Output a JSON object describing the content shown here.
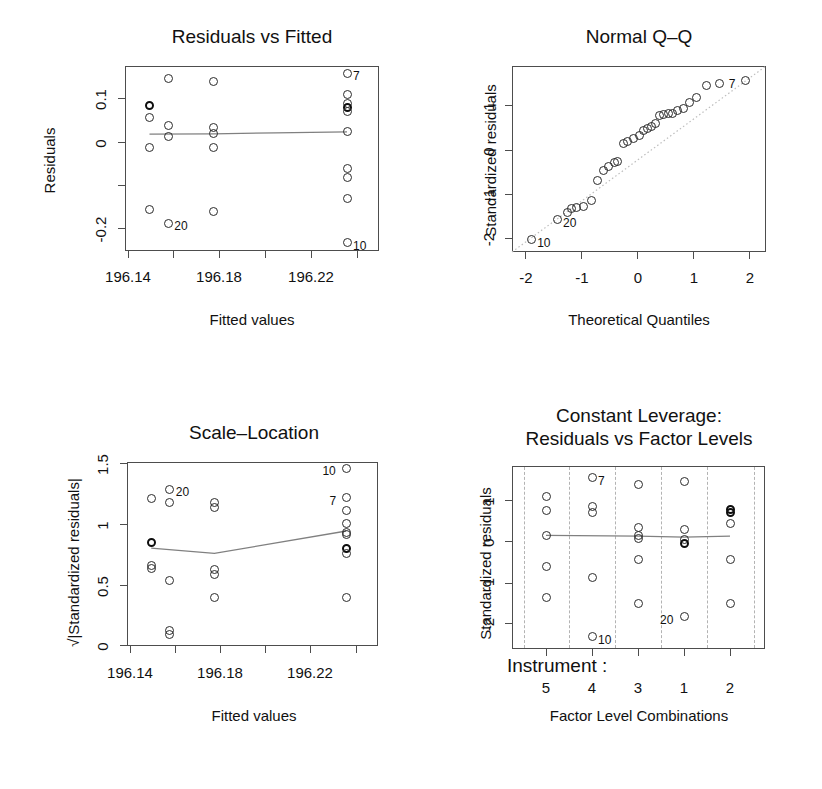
{
  "figure": {
    "kind": "R regression diagnostic plots (2x2)",
    "background": "#ffffff",
    "point_color": "#2b2b2b",
    "line_color": "#808080",
    "grid_color": "#b3b3b3"
  },
  "chart_data": [
    {
      "type": "scatter",
      "panel": "top-left",
      "title": "Residuals vs Fitted",
      "xlabel": "Fitted values",
      "ylabel": "Residuals",
      "xlim": [
        196.12,
        196.255
      ],
      "ylim": [
        -0.24,
        0.145
      ],
      "xticks": [
        196.14,
        196.18,
        196.22
      ],
      "xticks_all": [
        196.14,
        196.16,
        196.18,
        196.2,
        196.22,
        196.24
      ],
      "yticks": [
        0.1,
        0.0,
        -0.2
      ],
      "yticks_all": [
        0.1,
        0.0,
        -0.1,
        -0.2
      ],
      "grid": false,
      "legend": "none",
      "points": [
        {
          "x": 196.133,
          "y": 0.063,
          "bold": true
        },
        {
          "x": 196.133,
          "y": 0.037
        },
        {
          "x": 196.133,
          "y": -0.025
        },
        {
          "x": 196.133,
          "y": -0.153
        },
        {
          "x": 196.143,
          "y": 0.118
        },
        {
          "x": 196.143,
          "y": 0.022
        },
        {
          "x": 196.143,
          "y": -0.002
        },
        {
          "x": 196.143,
          "y": -0.182,
          "label": "20"
        },
        {
          "x": 196.167,
          "y": 0.113
        },
        {
          "x": 196.167,
          "y": 0.018
        },
        {
          "x": 196.167,
          "y": 0.004
        },
        {
          "x": 196.167,
          "y": -0.024
        },
        {
          "x": 196.167,
          "y": -0.157
        },
        {
          "x": 196.238,
          "y": 0.13,
          "label": "7"
        },
        {
          "x": 196.238,
          "y": 0.085
        },
        {
          "x": 196.238,
          "y": 0.067
        },
        {
          "x": 196.238,
          "y": 0.058,
          "bold": true
        },
        {
          "x": 196.238,
          "y": 0.05
        },
        {
          "x": 196.238,
          "y": 0.008
        },
        {
          "x": 196.238,
          "y": -0.068
        },
        {
          "x": 196.238,
          "y": -0.086
        },
        {
          "x": 196.238,
          "y": -0.13
        },
        {
          "x": 196.238,
          "y": -0.223,
          "label": "10"
        }
      ],
      "smoother": [
        {
          "x": 196.133,
          "y": 0.003
        },
        {
          "x": 196.167,
          "y": 0.004
        },
        {
          "x": 196.2,
          "y": 0.006
        },
        {
          "x": 196.238,
          "y": 0.008
        }
      ]
    },
    {
      "type": "scatter",
      "panel": "top-right",
      "title": "Normal Q–Q",
      "xlabel": "Theoretical Quantiles",
      "ylabel": "Standardized residuals",
      "xlim": [
        -2.45,
        2.45
      ],
      "ylim": [
        -2.45,
        1.75
      ],
      "xticks": [
        -2,
        -1,
        0,
        1,
        2
      ],
      "yticks": [
        1,
        0,
        -1,
        -2
      ],
      "grid": false,
      "legend": "none",
      "reference_line": {
        "from": [
          -2.45,
          -2.45
        ],
        "to": [
          2.45,
          1.75
        ],
        "style": "dotted"
      },
      "points": [
        {
          "x": -2.08,
          "y": -2.17,
          "label": "10",
          "label_side": "right"
        },
        {
          "x": -1.58,
          "y": -1.72,
          "label": "20",
          "label_side": "right"
        },
        {
          "x": -1.38,
          "y": -1.55
        },
        {
          "x": -1.3,
          "y": -1.47
        },
        {
          "x": -1.2,
          "y": -1.44
        },
        {
          "x": -1.08,
          "y": -1.42
        },
        {
          "x": -0.92,
          "y": -1.28
        },
        {
          "x": -0.8,
          "y": -0.83
        },
        {
          "x": -0.68,
          "y": -0.62
        },
        {
          "x": -0.58,
          "y": -0.52
        },
        {
          "x": -0.48,
          "y": -0.42
        },
        {
          "x": -0.42,
          "y": -0.4
        },
        {
          "x": -0.3,
          "y": 0.0
        },
        {
          "x": -0.22,
          "y": 0.04
        },
        {
          "x": -0.1,
          "y": 0.12
        },
        {
          "x": 0.0,
          "y": 0.18
        },
        {
          "x": 0.08,
          "y": 0.3
        },
        {
          "x": 0.16,
          "y": 0.34
        },
        {
          "x": 0.24,
          "y": 0.38
        },
        {
          "x": 0.32,
          "y": 0.46
        },
        {
          "x": 0.4,
          "y": 0.64
        },
        {
          "x": 0.48,
          "y": 0.66
        },
        {
          "x": 0.56,
          "y": 0.68
        },
        {
          "x": 0.64,
          "y": 0.68
        },
        {
          "x": 0.74,
          "y": 0.74
        },
        {
          "x": 0.86,
          "y": 0.8
        },
        {
          "x": 0.98,
          "y": 0.92
        },
        {
          "x": 1.1,
          "y": 1.04
        },
        {
          "x": 1.3,
          "y": 1.3
        },
        {
          "x": 1.56,
          "y": 1.36
        },
        {
          "x": 2.06,
          "y": 1.42,
          "label": "7",
          "label_side": "left"
        }
      ]
    },
    {
      "type": "scatter",
      "panel": "bottom-left",
      "title": "Scale–Location",
      "xlabel": "Fitted values",
      "ylabel": "√|Standardized residuals|",
      "xlim": [
        196.12,
        196.255
      ],
      "ylim": [
        -0.03,
        1.53
      ],
      "xticks": [
        196.14,
        196.18,
        196.22
      ],
      "xticks_all": [
        196.14,
        196.16,
        196.18,
        196.2,
        196.22,
        196.24
      ],
      "yticks": [
        1.5,
        1.0,
        0.5,
        0.0
      ],
      "grid": false,
      "legend": "none",
      "points": [
        {
          "x": 196.133,
          "y": 1.22
        },
        {
          "x": 196.133,
          "y": 0.845,
          "bold": true
        },
        {
          "x": 196.133,
          "y": 0.655
        },
        {
          "x": 196.133,
          "y": 0.625
        },
        {
          "x": 196.143,
          "y": 1.3,
          "label": "20",
          "label_side": "right"
        },
        {
          "x": 196.143,
          "y": 1.19
        },
        {
          "x": 196.143,
          "y": 0.525
        },
        {
          "x": 196.143,
          "y": 0.105
        },
        {
          "x": 196.143,
          "y": 0.065
        },
        {
          "x": 196.167,
          "y": 1.185
        },
        {
          "x": 196.167,
          "y": 1.145
        },
        {
          "x": 196.167,
          "y": 0.615
        },
        {
          "x": 196.167,
          "y": 0.575
        },
        {
          "x": 196.167,
          "y": 0.385
        },
        {
          "x": 196.238,
          "y": 1.475,
          "label": "10",
          "label_side": "left"
        },
        {
          "x": 196.238,
          "y": 1.225,
          "label": "7",
          "label_side": "left"
        },
        {
          "x": 196.238,
          "y": 1.115
        },
        {
          "x": 196.238,
          "y": 1.01
        },
        {
          "x": 196.238,
          "y": 0.935
        },
        {
          "x": 196.238,
          "y": 0.915
        },
        {
          "x": 196.238,
          "y": 0.795,
          "bold": true
        },
        {
          "x": 196.238,
          "y": 0.755
        },
        {
          "x": 196.238,
          "y": 0.385
        }
      ],
      "smoother": [
        {
          "x": 196.133,
          "y": 0.8
        },
        {
          "x": 196.167,
          "y": 0.755
        },
        {
          "x": 196.238,
          "y": 0.945
        }
      ]
    },
    {
      "type": "scatter",
      "panel": "bottom-right",
      "title_line1": "Constant Leverage:",
      "title_line2": "Residuals vs Factor Levels",
      "xlabel": "Factor Level Combinations",
      "ylabel": "Standardized residuals",
      "factor_group_label": "Instrument :",
      "factor_levels": [
        "5",
        "4",
        "3",
        "1",
        "2"
      ],
      "ylim": [
        -2.45,
        1.72
      ],
      "yticks": [
        1,
        0,
        -1,
        -2
      ],
      "grid": "vertical-dashed-separators",
      "legend": "none",
      "points": [
        {
          "level": "5",
          "dx": 0.0,
          "y": 1.02
        },
        {
          "level": "5",
          "dx": 0.0,
          "y": 0.7
        },
        {
          "level": "5",
          "dx": 0.0,
          "y": 0.14
        },
        {
          "level": "5",
          "dx": 0.0,
          "y": -0.58
        },
        {
          "level": "5",
          "dx": 0.0,
          "y": -1.27
        },
        {
          "level": "4",
          "dx": 0.0,
          "y": 1.45,
          "label": "7",
          "label_side": "right"
        },
        {
          "level": "4",
          "dx": 0.0,
          "y": 0.8
        },
        {
          "level": "4",
          "dx": 0.0,
          "y": 0.66
        },
        {
          "level": "4",
          "dx": 0.0,
          "y": -0.83
        },
        {
          "level": "4",
          "dx": 0.0,
          "y": -2.17,
          "label": "10",
          "label_side": "right"
        },
        {
          "level": "3",
          "dx": 0.0,
          "y": 1.3
        },
        {
          "level": "3",
          "dx": 0.0,
          "y": 0.32
        },
        {
          "level": "3",
          "dx": 0.0,
          "y": 0.14
        },
        {
          "level": "3",
          "dx": 0.0,
          "y": 0.06
        },
        {
          "level": "3",
          "dx": 0.0,
          "y": -0.4
        },
        {
          "level": "3",
          "dx": 0.0,
          "y": -1.42
        },
        {
          "level": "1",
          "dx": 0.0,
          "y": 1.36
        },
        {
          "level": "1",
          "dx": 0.0,
          "y": 0.28
        },
        {
          "level": "1",
          "dx": 0.0,
          "y": 0.04
        },
        {
          "level": "1",
          "dx": 0.0,
          "y": -0.04,
          "bold": true
        },
        {
          "level": "1",
          "dx": 0.0,
          "y": -1.72,
          "label": "20",
          "label_side": "left"
        },
        {
          "level": "2",
          "dx": 0.0,
          "y": 0.74,
          "bold": true
        },
        {
          "level": "2",
          "dx": 0.0,
          "y": 0.66,
          "bold": true
        },
        {
          "level": "2",
          "dx": 0.0,
          "y": 0.42
        },
        {
          "level": "2",
          "dx": 0.0,
          "y": -0.4
        },
        {
          "level": "2",
          "dx": 0.0,
          "y": -1.42
        }
      ],
      "smoother": [
        {
          "level": "5",
          "y": 0.14
        },
        {
          "level": "3",
          "y": 0.12
        },
        {
          "level": "1",
          "y": 0.1
        },
        {
          "level": "2",
          "y": 0.12
        }
      ]
    }
  ]
}
